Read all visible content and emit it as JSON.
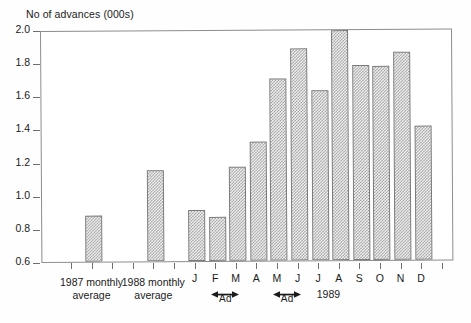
{
  "chart_data": {
    "type": "bar",
    "title": "No of advances (000s)",
    "ylabel": "No of advances (000s)",
    "xlabel": "",
    "ylim": [
      0.6,
      2.0
    ],
    "ytick_labels": [
      "2.0",
      "1.8",
      "1.6",
      "1.4",
      "1.2",
      "1.0",
      "0.8",
      "0.6"
    ],
    "ytick_values": [
      2.0,
      1.8,
      1.6,
      1.4,
      1.2,
      1.0,
      0.8,
      0.6
    ],
    "grid": false,
    "legend": null,
    "categories": [
      "1987 monthly average",
      "1988 monthly average",
      "J",
      "F",
      "M",
      "A",
      "M",
      "J",
      "J",
      "A",
      "S",
      "O",
      "N",
      "D"
    ],
    "values": [
      0.89,
      1.16,
      0.92,
      0.88,
      1.18,
      1.33,
      1.71,
      1.89,
      1.64,
      2.0,
      1.79,
      1.78,
      1.87,
      1.42
    ],
    "bars": [
      {
        "label": "1987 monthly",
        "label_line2": "average",
        "value": 0.89,
        "slot": 2
      },
      {
        "label": "1988 monthly",
        "label_line2": "average",
        "value": 1.16,
        "slot": 5
      },
      {
        "label": "J",
        "value": 0.92,
        "slot": 7
      },
      {
        "label": "F",
        "value": 0.88,
        "slot": 8
      },
      {
        "label": "M",
        "value": 1.18,
        "slot": 9
      },
      {
        "label": "A",
        "value": 1.33,
        "slot": 10
      },
      {
        "label": "M",
        "value": 1.71,
        "slot": 11
      },
      {
        "label": "J",
        "value": 1.89,
        "slot": 12
      },
      {
        "label": "J",
        "value": 1.64,
        "slot": 13
      },
      {
        "label": "A",
        "value": 2.0,
        "slot": 14
      },
      {
        "label": "S",
        "value": 1.79,
        "slot": 15
      },
      {
        "label": "O",
        "value": 1.78,
        "slot": 16
      },
      {
        "label": "N",
        "value": 1.87,
        "slot": 17
      },
      {
        "label": "D",
        "value": 1.42,
        "slot": 18
      }
    ],
    "annotations": [
      {
        "text": "Ad",
        "type": "double-arrow-span",
        "from": "F",
        "to": "M"
      },
      {
        "text": "Ad",
        "type": "double-arrow-span",
        "from": "M",
        "to": "J"
      },
      {
        "text": "1989",
        "type": "axis-period-label"
      }
    ],
    "colors": {
      "bar_fill": "#f3f3f3",
      "bar_hatch": "#9a9a9a",
      "bar_border": "#7b7b7b",
      "axis": "#6f6f6f",
      "text": "#1a1a1a",
      "background": "#ffffff"
    }
  }
}
